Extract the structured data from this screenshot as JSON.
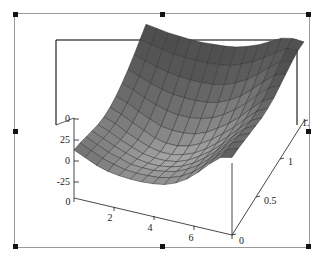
{
  "figure": {
    "kind": "3d-surface-plot",
    "background_color": "#ffffff",
    "frame_color": "#9a9a9a",
    "axis_color": "#1a1a1a",
    "mesh_line_color": "#2b2b2b",
    "selected": true
  },
  "selection": {
    "handle_color": "#141414",
    "handles": [
      "top-left",
      "top-center",
      "top-right",
      "middle-left",
      "middle-right",
      "bottom-left",
      "bottom-center",
      "bottom-right"
    ]
  },
  "chart_data": {
    "type": "surface",
    "title": "",
    "xlabel": "",
    "ylabel": "",
    "zlabel": "",
    "grid": false,
    "legend": "none",
    "projection": "3d-box",
    "xlim": [
      0,
      7
    ],
    "ylim": [
      0,
      1.5
    ],
    "zlim": [
      -37,
      58
    ],
    "x_ticks": [
      {
        "value": 0,
        "label": "0"
      },
      {
        "value": 2,
        "label": "2"
      },
      {
        "value": 4,
        "label": "4"
      },
      {
        "value": 6,
        "label": "6"
      }
    ],
    "y_ticks": [
      {
        "value": 0,
        "label": "0"
      },
      {
        "value": 0.5,
        "label": "0.5"
      },
      {
        "value": 1,
        "label": "1"
      },
      {
        "value": 1.5,
        "label": "1."
      }
    ],
    "z_ticks": [
      {
        "value": 50,
        "label": "0"
      },
      {
        "value": 25,
        "label": "25"
      },
      {
        "value": 0,
        "label": "0"
      },
      {
        "value": -25,
        "label": "-25"
      }
    ],
    "mesh": {
      "nx": 14,
      "ny": 12
    },
    "shading": {
      "colormap": "grayscale",
      "min_color": "#d2d2d2",
      "max_color": "#3a3a3a"
    },
    "surface_z": [
      [
        20,
        14,
        8,
        4,
        2,
        1,
        1,
        2,
        4,
        9,
        17,
        28,
        41,
        52,
        55
      ],
      [
        17,
        11,
        5,
        1,
        -2,
        -3,
        -3,
        -2,
        1,
        6,
        14,
        25,
        38,
        50,
        54
      ],
      [
        13,
        7,
        1,
        -3,
        -7,
        -8,
        -8,
        -6,
        -3,
        3,
        11,
        22,
        35,
        47,
        52
      ],
      [
        9,
        3,
        -3,
        -8,
        -12,
        -14,
        -14,
        -12,
        -8,
        -1,
        8,
        19,
        32,
        44,
        50
      ],
      [
        5,
        0,
        -7,
        -12,
        -17,
        -19,
        -19,
        -17,
        -12,
        -4,
        5,
        16,
        29,
        41,
        48
      ],
      [
        3,
        -2,
        -9,
        -15,
        -20,
        -23,
        -23,
        -20,
        -15,
        -7,
        3,
        14,
        27,
        39,
        46
      ],
      [
        3,
        -2,
        -9,
        -15,
        -21,
        -24,
        -24,
        -21,
        -15,
        -7,
        3,
        14,
        27,
        39,
        46
      ],
      [
        5,
        0,
        -7,
        -13,
        -18,
        -20,
        -20,
        -18,
        -13,
        -5,
        4,
        15,
        28,
        40,
        47
      ],
      [
        9,
        4,
        -2,
        -7,
        -11,
        -13,
        -13,
        -11,
        -7,
        0,
        9,
        20,
        33,
        44,
        50
      ],
      [
        14,
        9,
        4,
        0,
        -3,
        -4,
        -4,
        -3,
        0,
        6,
        14,
        25,
        37,
        48,
        53
      ],
      [
        20,
        16,
        12,
        9,
        7,
        6,
        6,
        7,
        10,
        15,
        22,
        32,
        43,
        53,
        56
      ],
      [
        27,
        24,
        21,
        19,
        18,
        18,
        18,
        19,
        21,
        26,
        32,
        40,
        49,
        57,
        58
      ],
      [
        34,
        32,
        30,
        29,
        28,
        28,
        29,
        30,
        32,
        36,
        41,
        48,
        55,
        58,
        57
      ]
    ]
  }
}
